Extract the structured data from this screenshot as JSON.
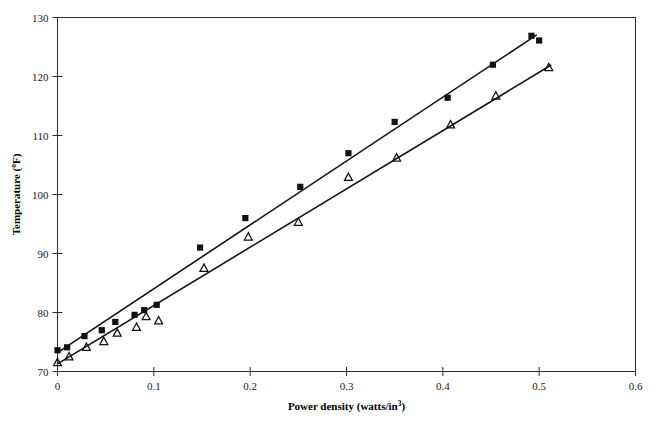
{
  "chart_data": {
    "type": "scatter",
    "title": "",
    "xlabel": "Power density (watts/in",
    "xlabel_sup": "3",
    "xlabel_tail": ")",
    "ylabel": "Temperature (",
    "ylabel_sup": "o",
    "ylabel_tail": "F)",
    "xlim": [
      0,
      0.6
    ],
    "ylim": [
      70,
      130
    ],
    "xticks": [
      0,
      0.1,
      0.2,
      0.3,
      0.4,
      0.5,
      0.6
    ],
    "xtick_labels": [
      "0",
      "0.1",
      "0.2",
      "0.3",
      "0.4",
      "0.5",
      "0.6"
    ],
    "yticks": [
      70,
      80,
      90,
      100,
      110,
      120,
      130
    ],
    "ytick_labels": [
      "70",
      "80",
      "90",
      "100",
      "110",
      "120",
      "130"
    ],
    "grid": false,
    "legend": "none",
    "frame": "box",
    "series": [
      {
        "name": "series-square",
        "marker": "filled-square",
        "color": "#111111",
        "points": [
          {
            "x": 0.0,
            "y": 73.6
          },
          {
            "x": 0.01,
            "y": 74.1
          },
          {
            "x": 0.028,
            "y": 76.0
          },
          {
            "x": 0.046,
            "y": 77.0
          },
          {
            "x": 0.06,
            "y": 78.4
          },
          {
            "x": 0.08,
            "y": 79.6
          },
          {
            "x": 0.09,
            "y": 80.4
          },
          {
            "x": 0.103,
            "y": 81.3
          },
          {
            "x": 0.148,
            "y": 91.0
          },
          {
            "x": 0.195,
            "y": 96.0
          },
          {
            "x": 0.252,
            "y": 101.3
          },
          {
            "x": 0.302,
            "y": 107.0
          },
          {
            "x": 0.35,
            "y": 112.3
          },
          {
            "x": 0.405,
            "y": 116.4
          },
          {
            "x": 0.452,
            "y": 122.0
          },
          {
            "x": 0.492,
            "y": 126.9
          },
          {
            "x": 0.5,
            "y": 126.1
          }
        ],
        "fit_line": {
          "x0": 0.0,
          "y0": 73.2,
          "x1": 0.497,
          "y1": 127.0
        }
      },
      {
        "name": "series-triangle",
        "marker": "open-triangle",
        "color": "#111111",
        "points": [
          {
            "x": 0.0,
            "y": 71.5
          },
          {
            "x": 0.012,
            "y": 72.5
          },
          {
            "x": 0.03,
            "y": 74.1
          },
          {
            "x": 0.048,
            "y": 75.1
          },
          {
            "x": 0.062,
            "y": 76.5
          },
          {
            "x": 0.082,
            "y": 77.5
          },
          {
            "x": 0.092,
            "y": 79.3
          },
          {
            "x": 0.105,
            "y": 78.6
          },
          {
            "x": 0.152,
            "y": 87.5
          },
          {
            "x": 0.198,
            "y": 92.8
          },
          {
            "x": 0.25,
            "y": 95.3
          },
          {
            "x": 0.302,
            "y": 102.9
          },
          {
            "x": 0.352,
            "y": 106.2
          },
          {
            "x": 0.408,
            "y": 111.8
          },
          {
            "x": 0.455,
            "y": 116.7
          },
          {
            "x": 0.51,
            "y": 121.5
          }
        ],
        "fit_line": {
          "x0": 0.0,
          "y0": 71.3,
          "x1": 0.512,
          "y1": 121.9
        }
      }
    ]
  }
}
